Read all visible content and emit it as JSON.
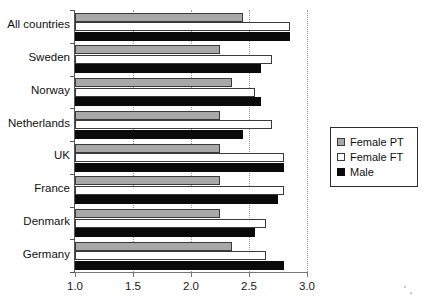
{
  "chart_data": {
    "type": "bar",
    "orientation": "horizontal",
    "title": "",
    "xlabel": "",
    "ylabel": "",
    "xlim": [
      1.0,
      3.0
    ],
    "xticks": [
      "1.0",
      "1.5",
      "2.0",
      "2.5",
      "3.0"
    ],
    "xtick_values": [
      1.0,
      1.5,
      2.0,
      2.5,
      3.0
    ],
    "grid": "vertical-dotted",
    "legend_position": "right-middle",
    "categories": [
      "All countries",
      "Sweden",
      "Norway",
      "Netherlands",
      "UK",
      "France",
      "Denmark",
      "Germany"
    ],
    "series": [
      {
        "name": "Female PT",
        "color": "#a8a8a8",
        "values": [
          2.45,
          2.25,
          2.35,
          2.25,
          2.25,
          2.25,
          2.25,
          2.35
        ]
      },
      {
        "name": "Female FT",
        "color": "#ffffff",
        "values": [
          2.85,
          2.7,
          2.55,
          2.7,
          2.8,
          2.8,
          2.65,
          2.65
        ]
      },
      {
        "name": "Male",
        "color": "#0a0a0a",
        "values": [
          2.85,
          2.6,
          2.6,
          2.45,
          2.8,
          2.75,
          2.55,
          2.8
        ]
      }
    ]
  },
  "legend": {
    "items": [
      {
        "label": "Female PT",
        "key": "pt"
      },
      {
        "label": "Female FT",
        "key": "ft"
      },
      {
        "label": "Male",
        "key": "male"
      }
    ]
  }
}
